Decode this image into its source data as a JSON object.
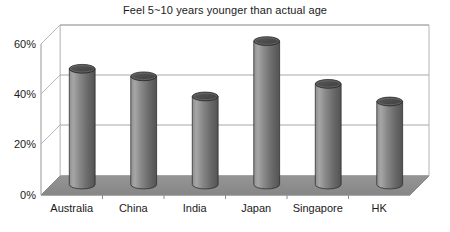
{
  "chart_data": {
    "type": "bar",
    "title": "Feel 5~10 years younger than actual age",
    "xlabel": "",
    "ylabel": "",
    "categories": [
      "Australia",
      "China",
      "India",
      "Japan",
      "Singapore",
      "HK"
    ],
    "values": [
      46,
      43,
      35,
      57,
      40,
      33
    ],
    "value_labels": [
      "",
      "",
      "",
      "",
      "",
      ""
    ],
    "ylim": [
      0,
      60
    ],
    "ytick_labels": [
      "0%",
      "20%",
      "40%",
      "60%"
    ],
    "ytick_values": [
      0,
      20,
      40,
      60
    ],
    "grid": true,
    "gridlines_at": [
      20,
      40,
      60
    ],
    "legend": null,
    "legend_position": "none",
    "style": {
      "three_d": true,
      "bar_shape": "cylinder",
      "bar_fill_light": "#a2a2a2",
      "bar_fill_mid": "#7d7d7d",
      "bar_fill_dark": "#565656",
      "bar_top_fill": "#4f4f4f",
      "bar_outline": "#2d2d2d",
      "floor_fill": "#8c8c8c",
      "wall_fill": "#ffffff",
      "frame_line": "#b4b4b4",
      "grid_line": "#a8a8a8",
      "text_color": "#1a1a1a",
      "background": "#ffffff"
    }
  },
  "axes": {
    "y_axis_name": "percentage-axis",
    "x_axis_name": "country-axis"
  }
}
